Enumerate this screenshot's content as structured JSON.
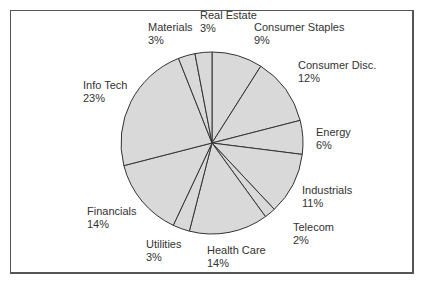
{
  "chart_data": {
    "type": "pie",
    "title": "",
    "start_angle_deg": 0,
    "direction": "clockwise",
    "categories": [
      "Consumer Staples",
      "Consumer Disc.",
      "Energy",
      "Industrials",
      "Telecom",
      "Health Care",
      "Utilities",
      "Financials",
      "Info Tech",
      "Materials",
      "Real Estate"
    ],
    "values": [
      9,
      12,
      6,
      11,
      2,
      14,
      3,
      14,
      23,
      3,
      3
    ],
    "value_labels": [
      "9%",
      "12%",
      "6%",
      "11%",
      "2%",
      "14%",
      "3%",
      "14%",
      "23%",
      "3%",
      "3%"
    ],
    "unit": "%",
    "legend": "none (direct labels)",
    "colors": {
      "fill": "#d9d9d9",
      "stroke": "#333333",
      "text": "#333333",
      "frame": "#555555"
    }
  },
  "labels": [
    {
      "name": "Consumer Staples",
      "pct": "9%",
      "x": 254,
      "y": 21
    },
    {
      "name": "Consumer Disc.",
      "pct": "12%",
      "x": 298,
      "y": 59
    },
    {
      "name": "Energy",
      "pct": "6%",
      "x": 316,
      "y": 126
    },
    {
      "name": "Industrials",
      "pct": "11%",
      "x": 302,
      "y": 184
    },
    {
      "name": "Telecom",
      "pct": "2%",
      "x": 293,
      "y": 221
    },
    {
      "name": "Health Care",
      "pct": "14%",
      "x": 207,
      "y": 244
    },
    {
      "name": "Utilities",
      "pct": "3%",
      "x": 146,
      "y": 238
    },
    {
      "name": "Financials",
      "pct": "14%",
      "x": 87,
      "y": 205
    },
    {
      "name": "Info Tech",
      "pct": "23%",
      "x": 83,
      "y": 79
    },
    {
      "name": "Materials",
      "pct": "3%",
      "x": 148,
      "y": 21
    },
    {
      "name": "Real Estate",
      "pct": "3%",
      "x": 200,
      "y": 9
    }
  ]
}
